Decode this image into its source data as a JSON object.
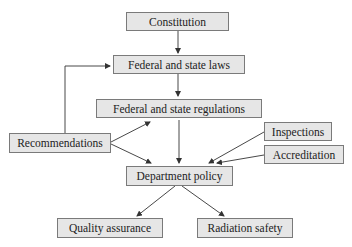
{
  "diagram": {
    "nodes": {
      "constitution": {
        "label": "Constitution"
      },
      "laws": {
        "label": "Federal and state laws"
      },
      "regulations": {
        "label": "Federal and state regulations"
      },
      "recommendations": {
        "label": "Recommendations"
      },
      "inspections": {
        "label": "Inspections"
      },
      "accreditation": {
        "label": "Accreditation"
      },
      "policy": {
        "label": "Department policy"
      },
      "quality": {
        "label": "Quality assurance"
      },
      "radiation": {
        "label": "Radiation safety"
      }
    },
    "edges": [
      {
        "from": "Constitution",
        "to": "Federal and state laws"
      },
      {
        "from": "Federal and state laws",
        "to": "Federal and state regulations"
      },
      {
        "from": "Recommendations",
        "to": "Federal and state laws"
      },
      {
        "from": "Recommendations",
        "to": "Federal and state regulations"
      },
      {
        "from": "Recommendations",
        "to": "Department policy"
      },
      {
        "from": "Federal and state regulations",
        "to": "Department policy"
      },
      {
        "from": "Inspections",
        "to": "Department policy"
      },
      {
        "from": "Accreditation",
        "to": "Department policy"
      },
      {
        "from": "Department policy",
        "to": "Quality assurance"
      },
      {
        "from": "Department policy",
        "to": "Radiation safety"
      }
    ],
    "colors": {
      "box_fill": "#e6e6e6",
      "box_border": "#7a7a7a",
      "line": "#333333"
    }
  }
}
